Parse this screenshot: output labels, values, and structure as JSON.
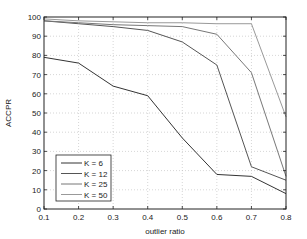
{
  "chart_data": {
    "type": "line",
    "title": "",
    "xlabel": "outlier ratio",
    "ylabel": "ACCPR",
    "x": [
      0.1,
      0.2,
      0.3,
      0.4,
      0.5,
      0.6,
      0.7,
      0.8
    ],
    "xlim": [
      0.1,
      0.8
    ],
    "ylim": [
      0,
      100
    ],
    "xticks": [
      "0.1",
      "0.2",
      "0.3",
      "0.4",
      "0.5",
      "0.6",
      "0.7",
      "0.8"
    ],
    "yticks": [
      "0",
      "10",
      "20",
      "30",
      "40",
      "50",
      "60",
      "70",
      "80",
      "90",
      "100"
    ],
    "grid": true,
    "legend_position": "lower left",
    "series": [
      {
        "name": "K = 6",
        "color": "#333333",
        "values": [
          79,
          76,
          64,
          59,
          37,
          18,
          17,
          8
        ]
      },
      {
        "name": "K = 12",
        "color": "#555555",
        "values": [
          98,
          96.5,
          95,
          93,
          87,
          75,
          22,
          15
        ]
      },
      {
        "name": "K = 25",
        "color": "#777777",
        "values": [
          98,
          97,
          96,
          95.5,
          95,
          91,
          71,
          17
        ]
      },
      {
        "name": "K = 50",
        "color": "#999999",
        "values": [
          99,
          98,
          97.5,
          97,
          97,
          96.5,
          96.5,
          48
        ]
      }
    ]
  }
}
